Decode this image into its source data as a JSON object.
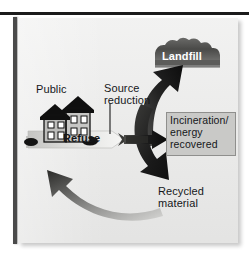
{
  "figure": {
    "background_color": "#ececeb",
    "frame_color": "#1b1b1b"
  },
  "labels": {
    "public": "Public",
    "source_reduction": "Source\nreduction",
    "refuse": "Refuse",
    "landfill": "Landfill",
    "incineration": "Incineration/\nenergy\nrecovered",
    "recycled": "Recycled\nmaterial"
  },
  "nodes": [
    {
      "name": "public-house",
      "label": "Public",
      "shape": "house-silhouette",
      "color": "#111111"
    },
    {
      "name": "landfill-mound",
      "label": "Landfill",
      "shape": "mound",
      "color": "#4e4e4e",
      "text_color": "#ffffff"
    },
    {
      "name": "incineration-box",
      "label": "Incineration/ energy recovered",
      "shape": "rectangle",
      "color": "#c9c9c7",
      "text_color": "#15171a"
    }
  ],
  "flows": [
    {
      "name": "refuse-arrow",
      "label": "Refuse",
      "from": "public-house",
      "to": "junction",
      "direction": "right",
      "color": "#d8d8d6"
    },
    {
      "name": "source-reduction-leader",
      "label": "Source reduction",
      "from": "source-reduction-label",
      "to": "refuse-arrow",
      "direction": "down",
      "color": "#2a2a2a"
    },
    {
      "name": "landfill-arrow",
      "label": "",
      "from": "junction",
      "to": "landfill-mound",
      "direction": "up-right",
      "color": "#1f1f1f"
    },
    {
      "name": "incineration-arrow",
      "label": "",
      "from": "junction",
      "to": "incineration-box",
      "direction": "right",
      "color": "#1f1f1f"
    },
    {
      "name": "recycled-arrow",
      "label": "Recycled material",
      "from": "junction",
      "to": "public-house",
      "direction": "curve-left",
      "color": "#6f6f6d"
    }
  ],
  "colors": {
    "panel": "#ececeb",
    "dark": "#1f1f1f",
    "mid_gray": "#6f6f6d",
    "light_gray": "#d8d8d6",
    "box_gray": "#c9c9c7",
    "white": "#ffffff"
  }
}
